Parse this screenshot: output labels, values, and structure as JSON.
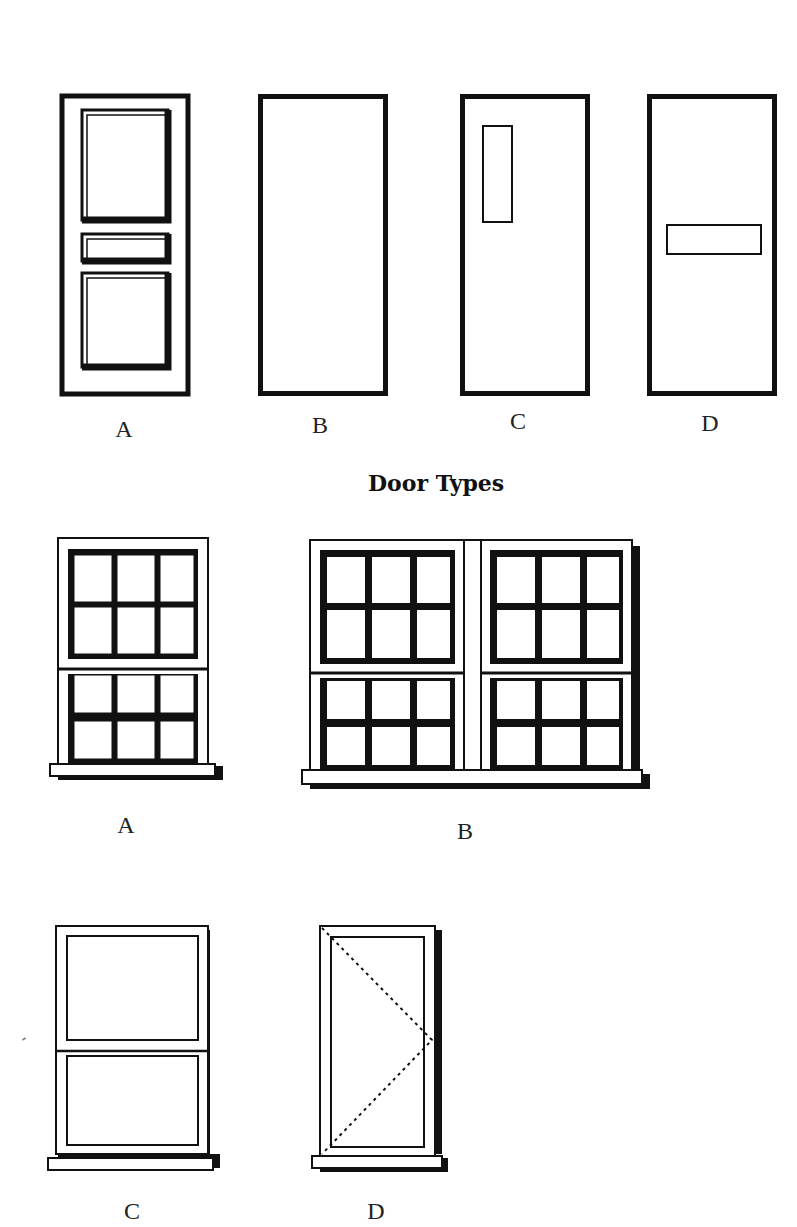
{
  "doors": {
    "title": "Door Types",
    "items": [
      {
        "label": "A",
        "style": "three-panel"
      },
      {
        "label": "B",
        "style": "flush"
      },
      {
        "label": "C",
        "style": "vertical-vision-panel"
      },
      {
        "label": "D",
        "style": "horizontal-vision-panel"
      }
    ]
  },
  "windows": {
    "items": [
      {
        "label": "A",
        "style": "sash-6-over-6"
      },
      {
        "label": "B",
        "style": "double-sash-6-over-6"
      },
      {
        "label": "C",
        "style": "sash-1-over-1"
      },
      {
        "label": "D",
        "style": "casement-side-hung"
      }
    ]
  },
  "colors": {
    "line": "#111111",
    "background": "#ffffff"
  }
}
